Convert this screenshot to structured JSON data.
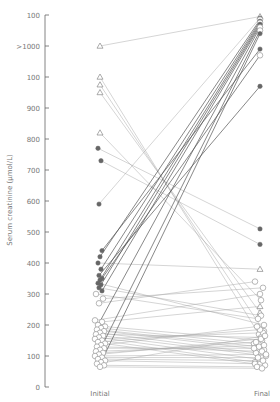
{
  "chart_data": {
    "type": "line",
    "subtype": "paired-slope",
    "title": "",
    "xlabel": "",
    "ylabel": "Serum creatinine (μmol/L)",
    "categories": [
      "Initial",
      "Final"
    ],
    "y_ticks": [
      {
        "value": 0,
        "label": "0"
      },
      {
        "value": 100,
        "label": "100"
      },
      {
        "value": 200,
        "label": "200"
      },
      {
        "value": 300,
        "label": "300"
      },
      {
        "value": 400,
        "label": "400"
      },
      {
        "value": 500,
        "label": "500"
      },
      {
        "value": 600,
        "label": "600"
      },
      {
        "value": 700,
        "label": "700"
      },
      {
        "value": 800,
        "label": "800"
      },
      {
        "value": 900,
        "label": "900"
      },
      {
        "value": 1000,
        "label": "100"
      },
      {
        "value": 1100,
        "label": ">1000"
      },
      {
        "value": 1200,
        "label": "100"
      }
    ],
    "ylim": [
      0,
      1200
    ],
    "grid": false,
    "legend": null,
    "marker_legend": {
      "triangle": "open triangle",
      "filled": "filled circle",
      "open": "open circle"
    },
    "series": [
      {
        "initial": 1100,
        "final": 1195,
        "m0": "tri",
        "m1": "tri"
      },
      {
        "initial": 1000,
        "final": 170,
        "m0": "tri",
        "m1": "open"
      },
      {
        "initial": 975,
        "final": 180,
        "m0": "tri",
        "m1": "open"
      },
      {
        "initial": 950,
        "final": 240,
        "m0": "tri",
        "m1": "tri"
      },
      {
        "initial": 820,
        "final": 280,
        "m0": "tri",
        "m1": "open"
      },
      {
        "initial": 770,
        "final": 510,
        "m0": "filled",
        "m1": "filled"
      },
      {
        "initial": 730,
        "final": 460,
        "m0": "filled",
        "m1": "filled"
      },
      {
        "initial": 590,
        "final": 1190,
        "m0": "filled",
        "m1": "filled"
      },
      {
        "initial": 440,
        "final": 1090,
        "m0": "filled",
        "m1": "filled"
      },
      {
        "initial": 420,
        "final": 1185,
        "m0": "filled",
        "m1": "open"
      },
      {
        "initial": 400,
        "final": 380,
        "m0": "filled",
        "m1": "tri"
      },
      {
        "initial": 380,
        "final": 1180,
        "m0": "filled",
        "m1": "filled"
      },
      {
        "initial": 360,
        "final": 970,
        "m0": "filled",
        "m1": "filled"
      },
      {
        "initial": 350,
        "final": 1070,
        "m0": "filled",
        "m1": "open"
      },
      {
        "initial": 345,
        "final": 1175,
        "m0": "filled",
        "m1": "open"
      },
      {
        "initial": 335,
        "final": 200,
        "m0": "filled",
        "m1": "open"
      },
      {
        "initial": 330,
        "final": 1170,
        "m0": "filled",
        "m1": "filled"
      },
      {
        "initial": 320,
        "final": 230,
        "m0": "filled",
        "m1": "open"
      },
      {
        "initial": 310,
        "final": 1165,
        "m0": "filled",
        "m1": "filled"
      },
      {
        "initial": 300,
        "final": 220,
        "m0": "open",
        "m1": "open"
      },
      {
        "initial": 285,
        "final": 320,
        "m0": "open",
        "m1": "open"
      },
      {
        "initial": 270,
        "final": 340,
        "m0": "open",
        "m1": "open"
      },
      {
        "initial": 215,
        "final": 300,
        "m0": "open",
        "m1": "open"
      },
      {
        "initial": 210,
        "final": 260,
        "m0": "open",
        "m1": "tri"
      },
      {
        "initial": 200,
        "final": 1160,
        "m0": "open",
        "m1": "open"
      },
      {
        "initial": 195,
        "final": 150,
        "m0": "open",
        "m1": "open"
      },
      {
        "initial": 190,
        "final": 140,
        "m0": "open",
        "m1": "open"
      },
      {
        "initial": 185,
        "final": 130,
        "m0": "open",
        "m1": "open"
      },
      {
        "initial": 180,
        "final": 120,
        "m0": "open",
        "m1": "open"
      },
      {
        "initial": 175,
        "final": 110,
        "m0": "open",
        "m1": "open"
      },
      {
        "initial": 170,
        "final": 160,
        "m0": "open",
        "m1": "open"
      },
      {
        "initial": 165,
        "final": 100,
        "m0": "open",
        "m1": "open"
      },
      {
        "initial": 160,
        "final": 90,
        "m0": "open",
        "m1": "open"
      },
      {
        "initial": 155,
        "final": 175,
        "m0": "open",
        "m1": "open"
      },
      {
        "initial": 150,
        "final": 80,
        "m0": "open",
        "m1": "open"
      },
      {
        "initial": 145,
        "final": 185,
        "m0": "open",
        "m1": "open"
      },
      {
        "initial": 140,
        "final": 70,
        "m0": "open",
        "m1": "open"
      },
      {
        "initial": 135,
        "final": 195,
        "m0": "open",
        "m1": "open"
      },
      {
        "initial": 130,
        "final": 115,
        "m0": "open",
        "m1": "open"
      },
      {
        "initial": 125,
        "final": 125,
        "m0": "open",
        "m1": "open"
      },
      {
        "initial": 120,
        "final": 1150,
        "m0": "open",
        "m1": "open"
      },
      {
        "initial": 115,
        "final": 135,
        "m0": "open",
        "m1": "open"
      },
      {
        "initial": 110,
        "final": 145,
        "m0": "open",
        "m1": "open"
      },
      {
        "initial": 105,
        "final": 155,
        "m0": "open",
        "m1": "open"
      },
      {
        "initial": 100,
        "final": 105,
        "m0": "open",
        "m1": "open"
      },
      {
        "initial": 95,
        "final": 95,
        "m0": "open",
        "m1": "open"
      },
      {
        "initial": 90,
        "final": 85,
        "m0": "open",
        "m1": "open"
      },
      {
        "initial": 85,
        "final": 75,
        "m0": "open",
        "m1": "open"
      },
      {
        "initial": 80,
        "final": 1140,
        "m0": "open",
        "m1": "filled"
      },
      {
        "initial": 75,
        "final": 165,
        "m0": "open",
        "m1": "open"
      },
      {
        "initial": 70,
        "final": 65,
        "m0": "open",
        "m1": "open"
      },
      {
        "initial": 65,
        "final": 60,
        "m0": "open",
        "m1": "open"
      }
    ]
  },
  "layout": {
    "x_initial": 100,
    "x_final": 260,
    "y_zero_px": 387,
    "px_per_unit": 0.31,
    "axis_x": 45,
    "colors": {
      "line": "#aaaaaa",
      "line_dark": "#555555",
      "marker_stroke": "#888888",
      "marker_fill": "#666666",
      "axis": "#666666",
      "text": "#777777"
    }
  }
}
